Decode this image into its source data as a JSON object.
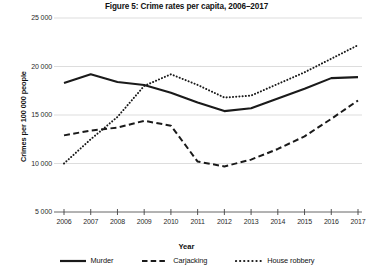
{
  "chart_data": {
    "type": "line",
    "title": "Figure 5: Crime rates per capita, 2006–2017",
    "xlabel": "Year",
    "ylabel": "Crimes per 100 000 people",
    "grid": true,
    "legend_position": "bottom",
    "xlim": [
      2006,
      2017
    ],
    "ylim": [
      5000,
      25000
    ],
    "ytick_labels": [
      "25 000",
      "20 000",
      "15 000",
      "10 000",
      "5 000"
    ],
    "ytick_values": [
      25000,
      20000,
      15000,
      10000,
      5000
    ],
    "categories": [
      "2006",
      "2007",
      "2008",
      "2009",
      "2010",
      "2011",
      "2012",
      "2013",
      "2014",
      "2015",
      "2016",
      "2017"
    ],
    "x": [
      2006,
      2007,
      2008,
      2009,
      2010,
      2011,
      2012,
      2013,
      2014,
      2015,
      2016,
      2017
    ],
    "series": [
      {
        "name": "Murder",
        "style": "solid",
        "color": "#1a1a1a",
        "values": [
          18300,
          19200,
          18400,
          18100,
          17300,
          16300,
          15400,
          15700,
          16700,
          17700,
          18800,
          18900
        ]
      },
      {
        "name": "Carjacking",
        "style": "dashed",
        "color": "#1a1a1a",
        "values": [
          12900,
          13400,
          13700,
          14400,
          13900,
          10200,
          9700,
          10400,
          11500,
          12800,
          14600,
          16500
        ]
      },
      {
        "name": "House robbery",
        "style": "dotted",
        "color": "#1a1a1a",
        "values": [
          10000,
          12500,
          14800,
          18000,
          19200,
          18100,
          16800,
          17000,
          18200,
          19400,
          20800,
          22200
        ]
      }
    ]
  },
  "figure": {
    "title": "Figure 5: Crime rates per capita, 2006–2017",
    "x_axis_title": "Year",
    "y_axis_title": "Crimes per 100 000 people"
  },
  "legend": {
    "items": [
      {
        "label": "Murder",
        "style": "solid"
      },
      {
        "label": "Carjacking",
        "style": "dashed"
      },
      {
        "label": "House robbery",
        "style": "dotted"
      }
    ]
  }
}
